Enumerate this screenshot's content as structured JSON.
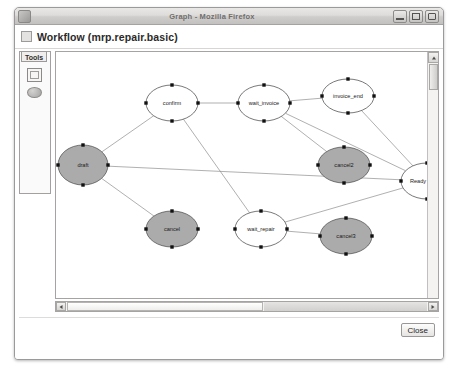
{
  "window": {
    "title": "Graph - Mozilla Firefox",
    "icon": "firefox-icon",
    "controls": [
      {
        "name": "minimize-button",
        "label": "–"
      },
      {
        "name": "maximize-button",
        "label": "□"
      },
      {
        "name": "close-button",
        "label": "×"
      }
    ]
  },
  "header": {
    "icon": "workflow-icon",
    "title": "Workflow (mrp.repair.basic)"
  },
  "tools": {
    "label": "Tools",
    "items": [
      {
        "name": "rectangle-tool",
        "icon": "rectangle-icon"
      },
      {
        "name": "ellipse-tool",
        "icon": "ellipse-icon"
      }
    ]
  },
  "footer": {
    "close_label": "Close"
  },
  "scrollbars": {
    "vertical": {
      "up_arrow": "▲",
      "thumb_position_pct": 4
    },
    "horizontal": {
      "left_arrow": "◄",
      "right_arrow": "►",
      "thumb_position_pct": 0
    }
  },
  "chart_data": {
    "type": "diagram",
    "title": "Workflow (mrp.repair.basic)",
    "layout": "directed-graph",
    "node_shape": "ellipse",
    "colors": {
      "node_fill_active": "#ffffff",
      "node_fill_end": "#ababab",
      "node_stroke": "#3d3d3d",
      "edge_stroke": "#8e8e8e",
      "handle": "#111111"
    },
    "nodes": [
      {
        "id": "draft",
        "label": "draft",
        "x": 57,
        "y": 168,
        "rx": 25,
        "ry": 20,
        "fill": "gray",
        "selected": true
      },
      {
        "id": "confirm",
        "label": "confirm",
        "x": 146,
        "y": 106,
        "rx": 26,
        "ry": 18,
        "fill": "white",
        "selected": true
      },
      {
        "id": "wait_invoice",
        "label": "wait_invoice",
        "x": 238,
        "y": 106,
        "rx": 26,
        "ry": 18,
        "fill": "white",
        "selected": true
      },
      {
        "id": "invoice_end",
        "label": "invoice_end",
        "x": 322,
        "y": 99,
        "rx": 26,
        "ry": 17,
        "fill": "white",
        "selected": true
      },
      {
        "id": "cancel2",
        "label": "cancel2",
        "x": 318,
        "y": 168,
        "rx": 26,
        "ry": 18,
        "fill": "gray",
        "selected": true
      },
      {
        "id": "ready_repair",
        "label": "Ready Repair",
        "x": 401,
        "y": 184,
        "rx": 26,
        "ry": 18,
        "fill": "white",
        "selected": true
      },
      {
        "id": "cancel",
        "label": "cancel",
        "x": 146,
        "y": 232,
        "rx": 26,
        "ry": 18,
        "fill": "gray",
        "selected": true
      },
      {
        "id": "wait_repair",
        "label": "wait_repair",
        "x": 235,
        "y": 232,
        "rx": 26,
        "ry": 18,
        "fill": "white",
        "selected": true
      },
      {
        "id": "cancel3",
        "label": "cancel3",
        "x": 320,
        "y": 239,
        "rx": 26,
        "ry": 18,
        "fill": "gray",
        "selected": true
      }
    ],
    "edges": [
      {
        "from": "draft",
        "to": "confirm"
      },
      {
        "from": "draft",
        "to": "cancel"
      },
      {
        "from": "draft",
        "to": "ready_repair"
      },
      {
        "from": "confirm",
        "to": "wait_invoice"
      },
      {
        "from": "confirm",
        "to": "wait_repair"
      },
      {
        "from": "wait_invoice",
        "to": "invoice_end"
      },
      {
        "from": "wait_invoice",
        "to": "cancel2"
      },
      {
        "from": "wait_invoice",
        "to": "ready_repair"
      },
      {
        "from": "invoice_end",
        "to": "ready_repair"
      },
      {
        "from": "wait_repair",
        "to": "cancel3"
      },
      {
        "from": "wait_repair",
        "to": "ready_repair"
      }
    ]
  }
}
